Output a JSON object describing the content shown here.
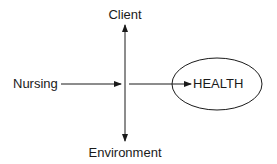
{
  "diagram": {
    "nodes": {
      "client": "Client",
      "environment": "Environment",
      "nursing": "Nursing",
      "health": "HEALTH"
    },
    "edges": [
      {
        "from": "nursing",
        "to": "center",
        "type": "arrow"
      },
      {
        "from": "center",
        "to": "health",
        "type": "arrow"
      },
      {
        "from": "center",
        "to": "client",
        "type": "arrow"
      },
      {
        "from": "center",
        "to": "environment",
        "type": "arrow"
      }
    ],
    "colors": {
      "stroke": "#1a1a1a",
      "background": "#ffffff"
    }
  }
}
